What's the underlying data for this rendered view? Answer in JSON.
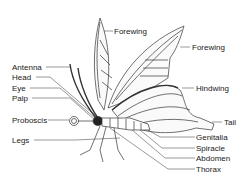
{
  "diagram": {
    "labels_left": [
      {
        "id": "antenna",
        "text": "Antenna"
      },
      {
        "id": "head",
        "text": "Head"
      },
      {
        "id": "eye",
        "text": "Eye"
      },
      {
        "id": "palp",
        "text": "Palp"
      },
      {
        "id": "proboscis",
        "text": "Proboscis"
      },
      {
        "id": "legs",
        "text": "Legs"
      }
    ],
    "labels_right": [
      {
        "id": "forewing-top",
        "text": "Forewing"
      },
      {
        "id": "forewing",
        "text": "Forewing"
      },
      {
        "id": "hindwing",
        "text": "Hindwing"
      },
      {
        "id": "tail",
        "text": "Tail"
      },
      {
        "id": "genitalia",
        "text": "Genitalia"
      },
      {
        "id": "spiracle",
        "text": "Spiracle"
      },
      {
        "id": "abdomen",
        "text": "Abdomen"
      },
      {
        "id": "thorax",
        "text": "Thorax"
      }
    ],
    "colors": {
      "line": "#333333",
      "text": "#1a1a1a",
      "background": "#ffffff"
    }
  }
}
